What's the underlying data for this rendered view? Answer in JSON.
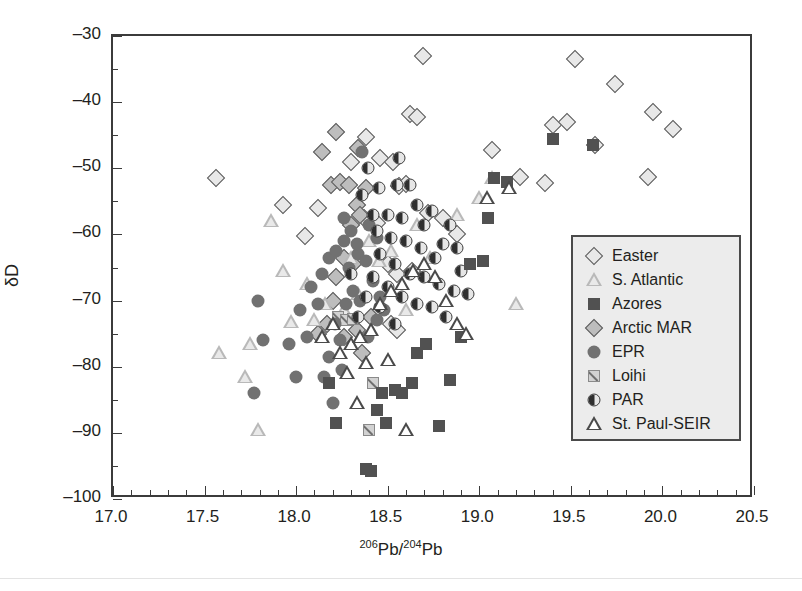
{
  "chart_data": {
    "type": "scatter",
    "title": "",
    "xlabel": "206Pb/204Pb",
    "xlabel_parts": {
      "sup1": "206",
      "base1": "Pb/",
      "sup2": "204",
      "base2": "Pb"
    },
    "ylabel": "δD",
    "xlim": [
      17.0,
      20.5
    ],
    "ylim": [
      -100,
      -30
    ],
    "x_major_step": 0.5,
    "x_minor_step": 0.1,
    "y_major_step": 10,
    "y_minor_step": 5,
    "x_ticks": [
      "17.0",
      "17.5",
      "18.0",
      "18.5",
      "19.0",
      "19.5",
      "20.0",
      "20.5"
    ],
    "y_ticks": [
      "-30",
      "-40",
      "-50",
      "-60",
      "-70",
      "-80",
      "-90",
      "-100"
    ],
    "grid": false,
    "legend_position": "right-middle",
    "marker_colors": {
      "easter": "#e8e8e8",
      "s_atlantic": "#b9b9b9",
      "azores": "#515151",
      "arctic_mar": "#bdbdbd",
      "epr": "#717171",
      "loihi": "#d2d2d2",
      "par": "#2f2f2f",
      "st_paul_seir": "#4a4a4a",
      "axis": "#3b3b3b",
      "legend_bg": "#ececec"
    },
    "series": [
      {
        "name": "Easter",
        "marker": "open-diamond",
        "points": [
          [
            17.56,
            -51.5
          ],
          [
            17.93,
            -55.5
          ],
          [
            18.05,
            -60.3
          ],
          [
            18.12,
            -56.0
          ],
          [
            18.3,
            -49.0
          ],
          [
            18.38,
            -45.2
          ],
          [
            18.46,
            -48.5
          ],
          [
            18.53,
            -49.0
          ],
          [
            18.56,
            -52.7
          ],
          [
            18.6,
            -52.4
          ],
          [
            18.62,
            -41.8
          ],
          [
            18.66,
            -42.2
          ],
          [
            18.69,
            -33.0
          ],
          [
            18.72,
            -56.8
          ],
          [
            18.5,
            -64.5
          ],
          [
            18.55,
            -66.0
          ],
          [
            18.63,
            -65.5
          ],
          [
            18.8,
            -57.5
          ],
          [
            18.52,
            -73.5
          ],
          [
            18.55,
            -74.5
          ],
          [
            19.07,
            -47.3
          ],
          [
            19.22,
            -51.3
          ],
          [
            19.36,
            -52.2
          ],
          [
            19.4,
            -43.5
          ],
          [
            19.48,
            -43.0
          ],
          [
            19.52,
            -33.5
          ],
          [
            19.63,
            -46.5
          ],
          [
            19.74,
            -37.3
          ],
          [
            19.92,
            -51.3
          ],
          [
            19.95,
            -41.5
          ],
          [
            20.06,
            -44.0
          ],
          [
            18.88,
            -60.0
          ],
          [
            18.44,
            -58.2
          ],
          [
            18.37,
            -57.5
          ]
        ]
      },
      {
        "name": "S. Atlantic",
        "marker": "light-triangle",
        "points": [
          [
            17.86,
            -58.0
          ],
          [
            17.93,
            -65.5
          ],
          [
            18.06,
            -67.5
          ],
          [
            17.97,
            -73.2
          ],
          [
            18.1,
            -73.0
          ],
          [
            17.75,
            -76.5
          ],
          [
            17.72,
            -81.5
          ],
          [
            17.58,
            -78.0
          ],
          [
            17.79,
            -89.5
          ],
          [
            18.16,
            -70.5
          ],
          [
            18.3,
            -63.5
          ],
          [
            18.45,
            -64.0
          ],
          [
            18.52,
            -62.5
          ],
          [
            18.66,
            -58.5
          ],
          [
            18.73,
            -63.5
          ],
          [
            18.6,
            -71.5
          ],
          [
            18.88,
            -57.0
          ],
          [
            19.0,
            -54.5
          ],
          [
            19.07,
            -51.5
          ],
          [
            19.2,
            -70.5
          ],
          [
            18.34,
            -69.0
          ],
          [
            18.26,
            -71.5
          ],
          [
            18.4,
            -61.0
          ]
        ]
      },
      {
        "name": "Azores",
        "marker": "filled-square",
        "points": [
          [
            18.18,
            -82.5
          ],
          [
            18.22,
            -88.5
          ],
          [
            18.38,
            -95.5
          ],
          [
            18.41,
            -95.8
          ],
          [
            18.47,
            -84.0
          ],
          [
            18.54,
            -83.5
          ],
          [
            18.58,
            -84.0
          ],
          [
            18.63,
            -82.5
          ],
          [
            18.66,
            -78.0
          ],
          [
            18.71,
            -76.5
          ],
          [
            18.78,
            -89.0
          ],
          [
            18.84,
            -82.0
          ],
          [
            18.9,
            -75.5
          ],
          [
            18.95,
            -64.5
          ],
          [
            19.02,
            -64.0
          ],
          [
            19.05,
            -57.5
          ],
          [
            19.08,
            -51.5
          ],
          [
            19.15,
            -52.0
          ],
          [
            19.4,
            -45.5
          ],
          [
            19.62,
            -46.5
          ],
          [
            18.49,
            -88.5
          ],
          [
            18.44,
            -86.5
          ]
        ]
      },
      {
        "name": "Arctic MAR",
        "marker": "gray-diamond",
        "points": [
          [
            18.19,
            -52.5
          ],
          [
            18.24,
            -52.0
          ],
          [
            18.29,
            -52.5
          ],
          [
            18.33,
            -55.5
          ],
          [
            18.35,
            -57.0
          ],
          [
            18.26,
            -63.5
          ],
          [
            18.31,
            -64.5
          ],
          [
            18.22,
            -66.5
          ],
          [
            18.2,
            -70.0
          ],
          [
            18.14,
            -47.5
          ],
          [
            18.22,
            -44.5
          ],
          [
            18.34,
            -47.0
          ],
          [
            18.38,
            -53.0
          ],
          [
            18.3,
            -58.5
          ],
          [
            18.17,
            -73.5
          ],
          [
            18.26,
            -75.5
          ],
          [
            18.33,
            -74.5
          ],
          [
            18.41,
            -72.5
          ],
          [
            18.12,
            -75.0
          ],
          [
            18.36,
            -78.0
          ]
        ]
      },
      {
        "name": "EPR",
        "marker": "filled-circle",
        "points": [
          [
            17.79,
            -70.0
          ],
          [
            17.82,
            -76.0
          ],
          [
            17.77,
            -84.0
          ],
          [
            18.0,
            -81.5
          ],
          [
            18.02,
            -71.5
          ],
          [
            18.08,
            -68.0
          ],
          [
            18.14,
            -66.0
          ],
          [
            18.18,
            -63.5
          ],
          [
            18.22,
            -62.5
          ],
          [
            18.26,
            -61.0
          ],
          [
            18.3,
            -59.5
          ],
          [
            18.34,
            -63.0
          ],
          [
            18.31,
            -68.5
          ],
          [
            18.27,
            -70.5
          ],
          [
            18.21,
            -73.5
          ],
          [
            18.24,
            -76.0
          ],
          [
            18.18,
            -78.5
          ],
          [
            18.15,
            -81.5
          ],
          [
            18.2,
            -85.5
          ],
          [
            18.36,
            -47.5
          ],
          [
            18.4,
            -58.5
          ],
          [
            18.44,
            -60.5
          ],
          [
            18.38,
            -64.0
          ],
          [
            18.42,
            -67.0
          ],
          [
            18.46,
            -69.5
          ],
          [
            18.33,
            -61.5
          ],
          [
            18.29,
            -65.0
          ],
          [
            18.12,
            -70.5
          ],
          [
            18.06,
            -75.5
          ],
          [
            18.44,
            -73.0
          ],
          [
            18.48,
            -71.5
          ],
          [
            17.96,
            -76.5
          ],
          [
            18.26,
            -57.5
          ],
          [
            18.35,
            -70.0
          ],
          [
            18.39,
            -75.5
          ],
          [
            18.25,
            -80.5
          ]
        ]
      },
      {
        "name": "Loihi",
        "marker": "light-square-slash",
        "points": [
          [
            18.23,
            -72.5
          ],
          [
            18.27,
            -73.0
          ],
          [
            18.31,
            -72.8
          ],
          [
            18.42,
            -82.5
          ],
          [
            18.4,
            -89.5
          ]
        ]
      },
      {
        "name": "PAR",
        "marker": "half-filled-circle",
        "points": [
          [
            18.39,
            -50.0
          ],
          [
            18.36,
            -54.0
          ],
          [
            18.45,
            -53.0
          ],
          [
            18.55,
            -52.5
          ],
          [
            18.62,
            -52.5
          ],
          [
            18.5,
            -57.0
          ],
          [
            18.58,
            -57.5
          ],
          [
            18.66,
            -55.5
          ],
          [
            18.7,
            -58.5
          ],
          [
            18.74,
            -56.5
          ],
          [
            18.44,
            -59.5
          ],
          [
            18.52,
            -60.5
          ],
          [
            18.6,
            -61.0
          ],
          [
            18.68,
            -62.0
          ],
          [
            18.76,
            -63.5
          ],
          [
            18.8,
            -61.5
          ],
          [
            18.84,
            -58.5
          ],
          [
            18.88,
            -62.0
          ],
          [
            18.46,
            -63.0
          ],
          [
            18.54,
            -64.5
          ],
          [
            18.62,
            -66.0
          ],
          [
            18.7,
            -66.5
          ],
          [
            18.78,
            -67.5
          ],
          [
            18.86,
            -68.5
          ],
          [
            18.42,
            -66.5
          ],
          [
            18.5,
            -68.0
          ],
          [
            18.58,
            -69.5
          ],
          [
            18.66,
            -70.5
          ],
          [
            18.74,
            -71.0
          ],
          [
            18.82,
            -72.5
          ],
          [
            18.38,
            -69.5
          ],
          [
            18.46,
            -71.0
          ],
          [
            18.34,
            -72.5
          ],
          [
            18.54,
            -73.5
          ],
          [
            18.9,
            -65.5
          ],
          [
            18.94,
            -69.0
          ],
          [
            18.3,
            -66.0
          ],
          [
            18.42,
            -57.0
          ],
          [
            18.56,
            -48.5
          ]
        ]
      },
      {
        "name": "St. Paul-SEIR",
        "marker": "dark-triangle",
        "points": [
          [
            18.3,
            -76.5
          ],
          [
            18.35,
            -75.5
          ],
          [
            18.41,
            -74.5
          ],
          [
            18.28,
            -81.0
          ],
          [
            18.2,
            -73.5
          ],
          [
            18.14,
            -75.5
          ],
          [
            18.46,
            -70.5
          ],
          [
            18.52,
            -68.5
          ],
          [
            18.58,
            -67.5
          ],
          [
            18.64,
            -65.5
          ],
          [
            18.7,
            -64.5
          ],
          [
            18.76,
            -66.5
          ],
          [
            18.82,
            -70.0
          ],
          [
            18.88,
            -73.5
          ],
          [
            18.93,
            -75.0
          ],
          [
            18.38,
            -79.5
          ],
          [
            18.33,
            -85.5
          ],
          [
            18.6,
            -89.5
          ],
          [
            19.04,
            -54.5
          ],
          [
            19.16,
            -53.0
          ],
          [
            18.5,
            -79.0
          ],
          [
            18.24,
            -78.0
          ]
        ]
      }
    ]
  },
  "legend": {
    "items": [
      {
        "label": "Easter",
        "marker": "open-diamond"
      },
      {
        "label": "S. Atlantic",
        "marker": "light-triangle"
      },
      {
        "label": "Azores",
        "marker": "filled-square"
      },
      {
        "label": "Arctic MAR",
        "marker": "gray-diamond"
      },
      {
        "label": "EPR",
        "marker": "filled-circle"
      },
      {
        "label": "Loihi",
        "marker": "light-square-slash"
      },
      {
        "label": "PAR",
        "marker": "half-filled-circle"
      },
      {
        "label": "St. Paul-SEIR",
        "marker": "dark-triangle"
      }
    ]
  }
}
